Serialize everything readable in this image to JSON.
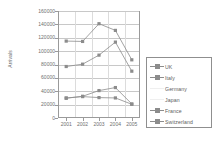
{
  "chart_data": {
    "type": "line",
    "title": "",
    "xlabel": "",
    "ylabel": "Arrivals",
    "categories": [
      "2001",
      "2002",
      "2003",
      "2004",
      "2005"
    ],
    "ylim": [
      0,
      160000
    ],
    "ytick_values": [
      0,
      20000,
      40000,
      60000,
      80000,
      100000,
      120000,
      140000,
      160000
    ],
    "ytick_labels": [
      "0",
      "20000",
      "40000",
      "60000",
      "80000",
      "100000",
      "120000",
      "140000",
      "160000"
    ],
    "grid": true,
    "legend_position": "right",
    "series": [
      {
        "name": "UK",
        "values": [
          115000,
          114500,
          141000,
          131000,
          87000
        ],
        "color": "#8c8c8c",
        "marker": "square"
      },
      {
        "name": "Italy",
        "values": [
          77000,
          80500,
          94000,
          113500,
          70000
        ],
        "color": "#8c8c8c",
        "marker": "square"
      },
      {
        "name": "Germany",
        "values": [
          null,
          null,
          null,
          null,
          null
        ],
        "color": "#efefef",
        "marker": "none"
      },
      {
        "name": "Japan",
        "values": [
          null,
          null,
          null,
          null,
          null
        ],
        "color": "#efefef",
        "marker": "none"
      },
      {
        "name": "France",
        "values": [
          29500,
          32500,
          41000,
          45500,
          21000
        ],
        "color": "#8c8c8c",
        "marker": "square"
      },
      {
        "name": "Switzerland",
        "values": [
          30000,
          32000,
          30500,
          30000,
          20500
        ],
        "color": "#8c8c8c",
        "marker": "square"
      }
    ]
  },
  "legend": {
    "items": [
      "UK",
      "Italy",
      "Germany",
      "Japan",
      "France",
      "Switzerland"
    ]
  },
  "colors": {
    "axis": "#9a9a9a",
    "grid": "#c8c8c8",
    "text": "#6f6f6f",
    "line": "#8c8c8c",
    "faint": "#efefef"
  }
}
